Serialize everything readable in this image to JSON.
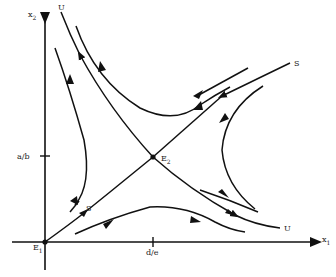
{
  "diagram": {
    "type": "phase-portrait",
    "axes": {
      "x": {
        "label": "x",
        "subscript": "1",
        "tick_label": "d/e"
      },
      "y": {
        "label": "x",
        "subscript": "2",
        "tick_label": "a/b"
      }
    },
    "equilibria": [
      {
        "name": "E",
        "subscript": "1",
        "position": "origin"
      },
      {
        "name": "E",
        "subscript": "2",
        "position": "(d/e, a/b)",
        "type": "saddle"
      }
    ],
    "manifold_labels": {
      "stable_upper": "S",
      "stable_lower": "S",
      "unstable_upper": "U",
      "unstable_lower": "U"
    },
    "colors": {
      "ink": "#111111",
      "background": "#ffffff"
    }
  }
}
